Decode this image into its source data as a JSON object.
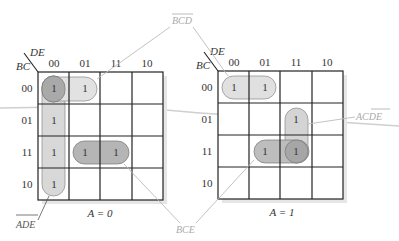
{
  "maps": [
    {
      "id": "a0",
      "caption": "A = 0",
      "row_var": "BC",
      "col_var": "DE",
      "col_headers": [
        "00",
        "01",
        "11",
        "10"
      ],
      "row_headers": [
        "00",
        "01",
        "11",
        "10"
      ],
      "cells": [
        [
          "1",
          "1",
          "",
          ""
        ],
        [
          "1",
          "",
          "",
          ""
        ],
        [
          "1",
          "1",
          "1",
          ""
        ],
        [
          "1",
          "",
          "",
          ""
        ]
      ],
      "groups": [
        {
          "term": "B̄CD",
          "label": "BCD",
          "overline": "full",
          "cells": "row 00, cols 00-01"
        },
        {
          "term": "ĀD̄Ē",
          "label": "ADE",
          "overline": "full",
          "cells": "col 00, rows 00-10"
        },
        {
          "term": "BCE",
          "label": "BCE",
          "overline": "none",
          "cells": "row 11, cols 01-11"
        }
      ]
    },
    {
      "id": "a1",
      "caption": "A = 1",
      "row_var": "BC",
      "col_var": "DE",
      "col_headers": [
        "00",
        "01",
        "11",
        "10"
      ],
      "row_headers": [
        "00",
        "01",
        "11",
        "10"
      ],
      "cells": [
        [
          "1",
          "1",
          "",
          ""
        ],
        [
          "",
          "",
          "1",
          ""
        ],
        [
          "",
          "1",
          "1",
          ""
        ],
        [
          "",
          "",
          "",
          ""
        ]
      ],
      "groups": [
        {
          "term": "B̄CD",
          "label": "BCD",
          "overline": "full",
          "cells": "row 00, cols 00-01"
        },
        {
          "term": "ACDE",
          "label": "ACDE",
          "overline": "partial",
          "cells": "col 11, rows 01-11"
        },
        {
          "term": "BCE",
          "label": "BCE",
          "overline": "none",
          "cells": "row 11, cols 01-11"
        }
      ]
    }
  ],
  "annotations": {
    "bcd": "BCD",
    "ade": "ADE",
    "bce": "BCE",
    "acde": "ACDE"
  },
  "colors": {
    "grid": "#222222",
    "group_dark": "#b0b0b0",
    "group_light": "#dedede",
    "leader": "#bbbbbb",
    "shadow": "#e4e4e4"
  }
}
